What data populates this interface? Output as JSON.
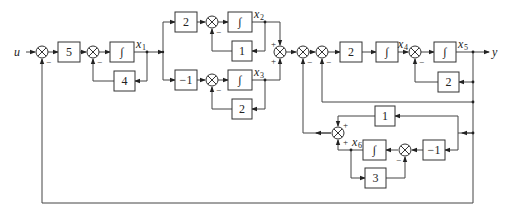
{
  "diagram": {
    "type": "control-system-block-diagram",
    "input_label": "u",
    "output_label": "y",
    "state_labels": {
      "x1": "x",
      "x1_sub": "1",
      "x2": "x",
      "x2_sub": "2",
      "x3": "x",
      "x3_sub": "3",
      "x4": "x",
      "x4_sub": "4",
      "x5": "x",
      "x5_sub": "5",
      "x6": "x",
      "x6_sub": "6"
    },
    "integrator_symbol": "∫",
    "blocks": {
      "gain_5": "5",
      "gain_4": "4",
      "gain_2_top": "2",
      "gain_1_top": "1",
      "gain_neg1_mid": "−1",
      "gain_2_mid": "2",
      "gain_2_forward": "2",
      "gain_2_fb": "2",
      "gain_1_lower": "1",
      "gain_neg1_lower": "−1",
      "gain_3": "3"
    },
    "signs": {
      "minus": "−",
      "plus": "+"
    }
  }
}
